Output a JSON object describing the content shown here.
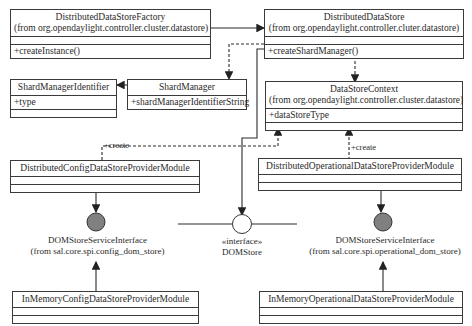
{
  "classes": {
    "factory": {
      "name": "DistributedDataStoreFactory",
      "pkg": "(from org.opendaylight.controller.cluster.datastore)",
      "attr": "",
      "op": "+createInstance()"
    },
    "store": {
      "name": "DistributedDataStore",
      "pkg": "(from org.opendaylight.controller.cluter.datastore)",
      "attr": "",
      "op": "+createShardManager()"
    },
    "smid": {
      "name": "ShardManagerIdentifier",
      "attr": "+type",
      "op": ""
    },
    "sm": {
      "name": "ShardManager",
      "attr": "+shardManagerIdentifierString"
    },
    "ctx": {
      "name": "DataStoreContext",
      "pkg": "(from org.opendaylight.controller.cluster.datastore)",
      "attr": "+dataStoreType",
      "op": ""
    },
    "cfgmod": {
      "name": "DistributedConfigDataStoreProviderModule"
    },
    "opmod": {
      "name": "DistributedOperationalDataStoreProviderModule"
    },
    "imcfg": {
      "name": "InMemoryConfigDataStoreProviderModule"
    },
    "imop": {
      "name": "InMemoryOperationalDataStoreProviderModule"
    }
  },
  "interfaces": {
    "cfg": {
      "name": "DOMStoreServiceInterface",
      "pkg": "(from sal.core.spi.config_dom_store)",
      "fill": "#808080"
    },
    "dom": {
      "stereotype": "«interface»",
      "name": "DOMStore",
      "fill": "#ffffff"
    },
    "op": {
      "name": "DOMStoreServiceInterface",
      "pkg": "(from sal.core.spi.operational_dom_store)",
      "fill": "#808080"
    }
  },
  "labels": {
    "create_left": "+create",
    "create_right": "+create"
  }
}
